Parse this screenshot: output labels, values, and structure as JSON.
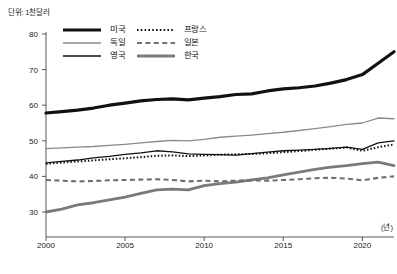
{
  "unit_note": "단위: 1천달러",
  "x_axis_unit": "(년)",
  "legend": {
    "items": [
      {
        "label": "미국",
        "style": "solid-thick-black",
        "color": "#111111"
      },
      {
        "label": "프랑스",
        "style": "dotted-black",
        "color": "#111111"
      },
      {
        "label": "독일",
        "style": "solid-thin-gray",
        "color": "#7a7a7a"
      },
      {
        "label": "일본",
        "style": "dashed-gray",
        "color": "#7a7a7a"
      },
      {
        "label": "영국",
        "style": "solid-thin-black",
        "color": "#111111"
      },
      {
        "label": "한국",
        "style": "solid-thick-gray",
        "color": "#7a7a7a"
      }
    ]
  },
  "axes": {
    "y_ticks": [
      "30",
      "40",
      "50",
      "60",
      "70",
      "80"
    ],
    "x_ticks": [
      "2000",
      "2005",
      "2010",
      "2015",
      "2020"
    ]
  },
  "chart_data": {
    "type": "line",
    "title": "",
    "subtitle": "",
    "xlabel": "(년)",
    "ylabel": "단위: 1천달러",
    "xlim": [
      2000,
      2022
    ],
    "ylim": [
      27,
      82
    ],
    "y_ticks": [
      30,
      40,
      50,
      60,
      70,
      80
    ],
    "x_ticks": [
      2000,
      2005,
      2010,
      2015,
      2020
    ],
    "grid": false,
    "legend_position": "top-center",
    "x": [
      2000,
      2001,
      2002,
      2003,
      2004,
      2005,
      2006,
      2007,
      2008,
      2009,
      2010,
      2011,
      2012,
      2013,
      2014,
      2015,
      2016,
      2017,
      2018,
      2019,
      2020,
      2021,
      2022
    ],
    "series": [
      {
        "name": "미국",
        "style": "solid-thick-black",
        "color": "#111111",
        "values": [
          57.8,
          58.2,
          58.6,
          59.2,
          60.0,
          60.6,
          61.2,
          61.6,
          61.8,
          61.5,
          62.0,
          62.4,
          63.0,
          63.2,
          64.0,
          64.6,
          64.9,
          65.4,
          66.2,
          67.2,
          68.6,
          71.8,
          75.0
        ]
      },
      {
        "name": "독일",
        "style": "solid-thin-gray",
        "color": "#7a7a7a",
        "values": [
          47.8,
          48.0,
          48.2,
          48.4,
          48.7,
          49.0,
          49.4,
          49.8,
          50.1,
          50.0,
          50.4,
          51.0,
          51.3,
          51.6,
          52.0,
          52.4,
          52.9,
          53.4,
          54.0,
          54.6,
          55.0,
          56.4,
          56.2
        ]
      },
      {
        "name": "영국",
        "style": "solid-thin-black",
        "color": "#111111",
        "values": [
          43.8,
          44.2,
          44.6,
          45.2,
          45.6,
          46.2,
          46.6,
          47.2,
          46.9,
          46.3,
          46.2,
          46.1,
          46.0,
          46.4,
          46.8,
          47.2,
          47.4,
          47.6,
          47.9,
          48.2,
          47.6,
          49.4,
          50.0
        ]
      },
      {
        "name": "프랑스",
        "style": "dotted-black",
        "color": "#111111",
        "values": [
          43.5,
          43.9,
          44.2,
          44.5,
          44.8,
          45.1,
          45.4,
          45.8,
          45.9,
          45.7,
          45.9,
          46.1,
          46.2,
          46.3,
          46.5,
          46.8,
          47.1,
          47.5,
          47.8,
          48.1,
          47.2,
          48.2,
          49.0
        ]
      },
      {
        "name": "일본",
        "style": "dashed-gray",
        "color": "#7a7a7a",
        "values": [
          39.0,
          38.8,
          38.6,
          38.7,
          38.9,
          39.0,
          39.1,
          39.2,
          39.0,
          38.6,
          38.8,
          38.6,
          38.8,
          38.9,
          38.8,
          39.0,
          39.2,
          39.5,
          39.6,
          39.4,
          38.9,
          39.6,
          40.0
        ]
      },
      {
        "name": "한국",
        "style": "solid-thick-gray",
        "color": "#7a7a7a",
        "values": [
          30.0,
          30.8,
          32.0,
          32.6,
          33.4,
          34.2,
          35.2,
          36.2,
          36.4,
          36.2,
          37.4,
          38.0,
          38.4,
          39.0,
          39.6,
          40.4,
          41.2,
          42.0,
          42.6,
          43.0,
          43.6,
          44.0,
          43.0
        ]
      }
    ]
  }
}
